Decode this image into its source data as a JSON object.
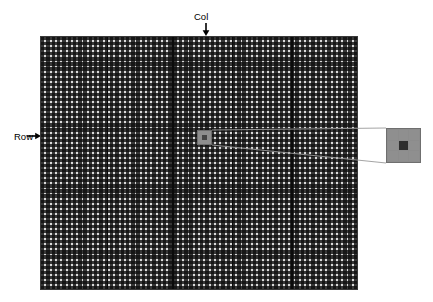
{
  "figure": {
    "name": "detector-pixel-array-diagram",
    "background_color": "#ffffff"
  },
  "labels": {
    "col": "Col",
    "row": "Row"
  },
  "arrows": {
    "col_direction": "down",
    "row_direction": "right",
    "color": "#000000"
  },
  "array": {
    "name": "pixel-array",
    "columns": 60,
    "rows": 50,
    "cell_color": "#2c2c2c",
    "gridline_color": "#e8e8e8",
    "border_color": "#3a3a3a",
    "section_divider_count": 4,
    "section_divider_color": "#0a0a0a",
    "section_divider_positions_pct": [
      20.8,
      41.5,
      60.4,
      79.2
    ]
  },
  "highlight": {
    "name": "selected-pixel",
    "fill_color": "#8e8e8e",
    "core_color": "#444444",
    "position_pct": {
      "x": 49.5,
      "y": 37.0
    }
  },
  "inset": {
    "name": "magnified-pixel-view",
    "grid_rows": 3,
    "grid_cols": 3,
    "cell_color": "#8f8f8f",
    "center_cell_color": "#2e2e2e",
    "border_color": "#6f6f6f",
    "cells": [
      [
        "light",
        "light",
        "light"
      ],
      [
        "light",
        "dark",
        "light"
      ],
      [
        "light",
        "light",
        "light"
      ]
    ]
  },
  "callout": {
    "name": "magnifier-connector",
    "line_color": "#9a9a9a"
  }
}
